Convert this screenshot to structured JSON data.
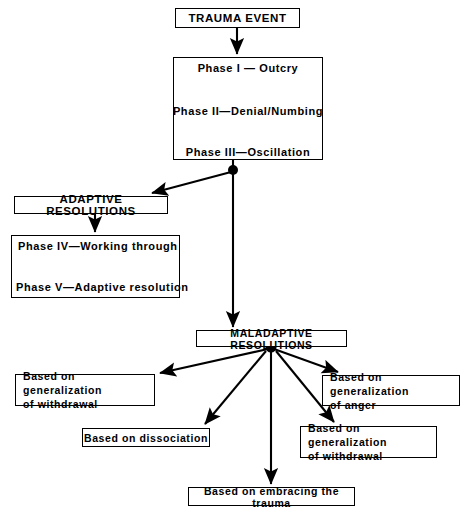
{
  "diagram": {
    "ink_color": "#000000",
    "background_color": "#ffffff"
  },
  "nodes": {
    "trauma_event": {
      "label": "TRAUMA EVENT"
    },
    "phase_group": {
      "label": ""
    },
    "phase_1": {
      "label": "Phase I — Outcry"
    },
    "phase_2": {
      "label": "Phase II—Denial/Numbing"
    },
    "phase_3": {
      "label": "Phase III—Oscillation"
    },
    "adaptive_resolutions": {
      "label": "ADAPTIVE RESOLUTIONS"
    },
    "adaptive_group": {
      "label": ""
    },
    "phase_4": {
      "label": "Phase IV—Working through"
    },
    "phase_5": {
      "label": "Phase V—Adaptive resolution"
    },
    "maladaptive_resolutions": {
      "label": "MALADAPTIVE RESOLUTIONS"
    },
    "outcome_withdrawal_left": {
      "line1": "Based on generalization",
      "line2": "of withdrawal"
    },
    "outcome_dissociation": {
      "line1": "Based on dissociation",
      "line2": ""
    },
    "outcome_anger": {
      "line1": "Based on generalization",
      "line2": "of anger"
    },
    "outcome_withdrawal_right": {
      "line1": "Based on generalization",
      "line2": "of withdrawal"
    },
    "outcome_embracing": {
      "line1": "Based on embracing the trauma",
      "line2": ""
    }
  },
  "hubs": {
    "phase_hub": {
      "name": "oscillation-branch-hub",
      "x": 233,
      "y": 170,
      "r": 5
    },
    "maladaptive_hub": {
      "name": "maladaptive-branch-hub",
      "x": 271,
      "y": 347,
      "r": 5.5
    }
  },
  "edges": [
    {
      "name": "trauma-to-phase1",
      "from": "trauma_event",
      "to": "phase_1"
    },
    {
      "name": "phase1-to-phase2",
      "from": "phase_1",
      "to": "phase_2"
    },
    {
      "name": "phase2-to-phase3",
      "from": "phase_2",
      "to": "phase_3"
    },
    {
      "name": "phase3-to-hub",
      "from": "phase_3",
      "to": "phase_hub"
    },
    {
      "name": "hub-to-adaptive",
      "from": "phase_hub",
      "to": "adaptive_resolutions"
    },
    {
      "name": "hub-to-maladaptive",
      "from": "phase_hub",
      "to": "maladaptive_resolutions"
    },
    {
      "name": "adaptive-to-phase4",
      "from": "adaptive_resolutions",
      "to": "phase_4"
    },
    {
      "name": "phase4-to-phase5",
      "from": "phase_4",
      "to": "phase_5"
    },
    {
      "name": "maladaptive-to-withdrawal-left",
      "from": "maladaptive_hub",
      "to": "outcome_withdrawal_left"
    },
    {
      "name": "maladaptive-to-dissociation",
      "from": "maladaptive_hub",
      "to": "outcome_dissociation"
    },
    {
      "name": "maladaptive-to-embracing",
      "from": "maladaptive_hub",
      "to": "outcome_embracing"
    },
    {
      "name": "maladaptive-to-withdrawal-right",
      "from": "maladaptive_hub",
      "to": "outcome_withdrawal_right"
    },
    {
      "name": "maladaptive-to-anger",
      "from": "maladaptive_hub",
      "to": "outcome_anger"
    }
  ]
}
